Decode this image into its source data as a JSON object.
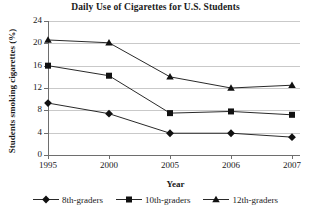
{
  "chart_data": {
    "type": "line",
    "title": "Daily Use of Cigarettes for U.S. Students",
    "xlabel": "Year",
    "ylabel": "Students smoking cigarettes (%)",
    "categories": [
      "1995",
      "2000",
      "2005",
      "2006",
      "2007"
    ],
    "yticks": [
      "0",
      "4",
      "8",
      "12",
      "16",
      "20",
      "24"
    ],
    "ylim": [
      0,
      24
    ],
    "grid": "horizontal",
    "legend_position": "bottom",
    "series": [
      {
        "name": "8th-graders",
        "marker": "diamond",
        "color": "#111111",
        "values": [
          9.3,
          7.4,
          3.9,
          3.9,
          3.2
        ]
      },
      {
        "name": "10th-graders",
        "marker": "square",
        "color": "#111111",
        "values": [
          16.0,
          14.2,
          7.5,
          7.8,
          7.2
        ]
      },
      {
        "name": "12th-graders",
        "marker": "triangle",
        "color": "#111111",
        "values": [
          20.6,
          20.1,
          14.0,
          12.0,
          12.5
        ]
      }
    ]
  }
}
